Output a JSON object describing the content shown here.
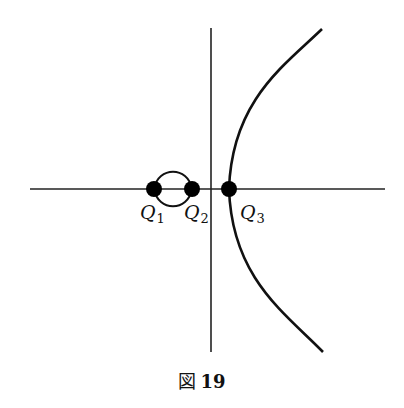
{
  "figure": {
    "caption_prefix": "図",
    "caption_number": "19",
    "points": [
      {
        "name": "Q",
        "sub": "1",
        "x": 154,
        "y": 189
      },
      {
        "name": "Q",
        "sub": "2",
        "x": 192,
        "y": 189
      },
      {
        "name": "Q",
        "sub": "3",
        "x": 229,
        "y": 189
      }
    ],
    "axes": {
      "horizontal": {
        "x1": 30,
        "x2": 385,
        "y": 189
      },
      "vertical": {
        "x": 211,
        "y1": 28,
        "y2": 352
      }
    },
    "colors": {
      "stroke": "#111111",
      "point": "#000000"
    }
  }
}
